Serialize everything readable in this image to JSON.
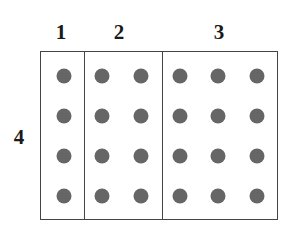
{
  "diagram": {
    "column_labels": [
      {
        "text": "1",
        "x": 61,
        "y": 32
      },
      {
        "text": "2",
        "x": 119,
        "y": 32
      },
      {
        "text": "3",
        "x": 219,
        "y": 32
      }
    ],
    "row_label": {
      "text": "4",
      "x": 19,
      "y": 137
    },
    "box": {
      "left": 40,
      "top": 51,
      "right": 278,
      "bottom": 220
    },
    "dividers_x": [
      84,
      162
    ],
    "dot_color": "#666666",
    "dot_columns_x": [
      64,
      102,
      141,
      180,
      218,
      257
    ],
    "dot_rows_y": [
      76,
      116,
      156,
      196
    ],
    "grid": {
      "rows": 4,
      "columns": 6,
      "groups": [
        1,
        2,
        3
      ],
      "total_dots": 24
    }
  }
}
